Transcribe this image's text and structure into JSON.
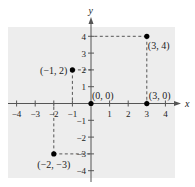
{
  "chart_data": {
    "type": "scatter",
    "title": "",
    "xlabel": "x",
    "ylabel": "y",
    "xlim": [
      -4,
      4
    ],
    "ylim": [
      -4,
      4
    ],
    "grid": false,
    "background": "#ededed",
    "x_ticks": [
      -4,
      -3,
      -2,
      -1,
      1,
      2,
      3,
      4
    ],
    "y_ticks": [
      -4,
      -3,
      -2,
      -1,
      1,
      2,
      3,
      4
    ],
    "x_tick_labels": [
      "−4",
      "−3",
      "−2",
      "−1",
      "1",
      "2",
      "3",
      "4"
    ],
    "y_tick_labels": [
      "−4",
      "−3",
      "−2",
      "−1",
      "1",
      "2",
      "3",
      "4"
    ],
    "points": [
      {
        "x": -1,
        "y": 2,
        "label": "(−1, 2)"
      },
      {
        "x": 3,
        "y": 4,
        "label": "(3, 4)"
      },
      {
        "x": 0,
        "y": 0,
        "label": "(0, 0)"
      },
      {
        "x": 3,
        "y": 0,
        "label": "(3, 0)"
      },
      {
        "x": -2,
        "y": -3,
        "label": "(−2, −3)"
      }
    ],
    "projection_lines": "dashed lines from each off-axis point to both axes"
  },
  "colors": {
    "background": "#ededed",
    "axis": "#555555",
    "point": "#000000",
    "dashed": "#444444"
  }
}
